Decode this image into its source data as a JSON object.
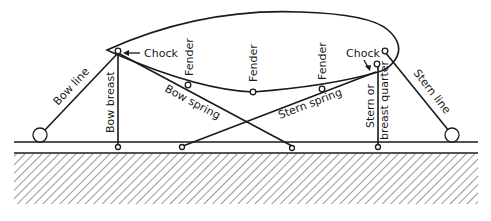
{
  "diagram": {
    "title": "",
    "colors": {
      "ink": "#1a1a1a",
      "background": "#ffffff"
    },
    "labels": {
      "chock_bow": "Chock",
      "chock_stern": "Chock",
      "fender_1": "Fender",
      "fender_2": "Fender",
      "fender_3": "Fender",
      "bow_line": "Bow line",
      "bow_breast": "Bow breast",
      "bow_spring": "Bow spring",
      "stern_spring": "Stern spring",
      "stern_or_breast_quarter_1": "Stern or",
      "stern_or_breast_quarter_2": "breast quarter",
      "stern_line": "Stern line"
    },
    "elements": [
      "ship hull",
      "pier edge",
      "water/ground hatching",
      "bollards",
      "mooring lines",
      "fenders",
      "chocks"
    ]
  }
}
